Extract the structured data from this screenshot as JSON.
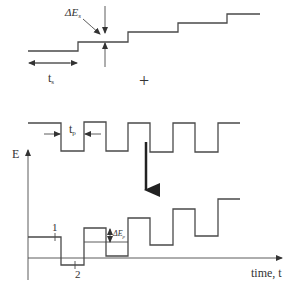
{
  "figure": {
    "top_panel": {
      "name": "staircase-waveform",
      "labels": {
        "step_height": "ΔE",
        "step_height_sub": "s",
        "step_time": "t",
        "step_time_sub": "s"
      }
    },
    "operator": "+",
    "middle_panel": {
      "name": "square-pulse-waveform",
      "labels": {
        "pulse_time": "t",
        "pulse_time_sub": "p"
      }
    },
    "bottom_panel": {
      "name": "combined-square-wave-voltammetry-waveform",
      "y_axis_label": "E",
      "x_axis_label": "time, t",
      "sample_points": [
        "1",
        "2"
      ],
      "pulse_amplitude": "ΔE",
      "pulse_amplitude_sub": "p"
    }
  }
}
